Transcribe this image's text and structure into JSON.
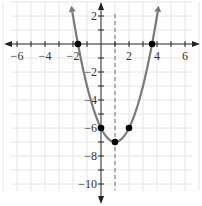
{
  "chart_data": {
    "type": "line",
    "title": "",
    "xlabel": "",
    "ylabel": "",
    "function": "y = x^2 - 2x - 6",
    "xlim": [
      -7,
      7
    ],
    "ylim": [
      -11,
      3
    ],
    "grid": true,
    "x_tick_labels": [
      "-6",
      "-4",
      "-2",
      "2",
      "4",
      "6"
    ],
    "y_tick_labels": [
      "2",
      "-2",
      "-4",
      "-6",
      "-8",
      "-10"
    ],
    "axis_of_symmetry": {
      "x": 1,
      "style": "dashed"
    },
    "points": [
      {
        "x": -1.65,
        "y": 0
      },
      {
        "x": 3.65,
        "y": 0
      },
      {
        "x": 0,
        "y": -6
      },
      {
        "x": 2,
        "y": -6
      },
      {
        "x": 1,
        "y": -7
      }
    ],
    "curve_color": "#7a7a7a",
    "point_color": "#000000"
  }
}
